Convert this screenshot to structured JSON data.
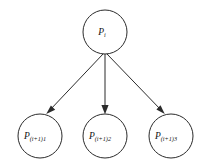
{
  "diagram": {
    "type": "tree",
    "background_color": "#ffffff",
    "stroke_color": "#2b2b2b",
    "text_color": "#111111",
    "parent": {
      "id": "node-parent",
      "label_main": "P",
      "label_sub": "i",
      "label_full": "P i",
      "cx": 105,
      "cy": 32,
      "r": 22
    },
    "children": [
      {
        "id": "node-child-1",
        "label_main": "P",
        "label_sub": "(i+1)1",
        "label_full": "P (i+1)1",
        "cx": 40,
        "cy": 136,
        "r": 22
      },
      {
        "id": "node-child-2",
        "label_main": "P",
        "label_sub": "(i+1)2",
        "label_full": "P (i+1)2",
        "cx": 105,
        "cy": 136,
        "r": 22
      },
      {
        "id": "node-child-3",
        "label_main": "P",
        "label_sub": "(i+1)3",
        "label_full": "P (i+1)3",
        "cx": 171,
        "cy": 136,
        "r": 22
      }
    ],
    "edges": [
      {
        "id": "edge-parent-child-1",
        "from": "node-parent",
        "to": "node-child-1",
        "direction": "down-left"
      },
      {
        "id": "edge-parent-child-2",
        "from": "node-parent",
        "to": "node-child-2",
        "direction": "down"
      },
      {
        "id": "edge-parent-child-3",
        "from": "node-parent",
        "to": "node-child-3",
        "direction": "down-right"
      }
    ]
  }
}
